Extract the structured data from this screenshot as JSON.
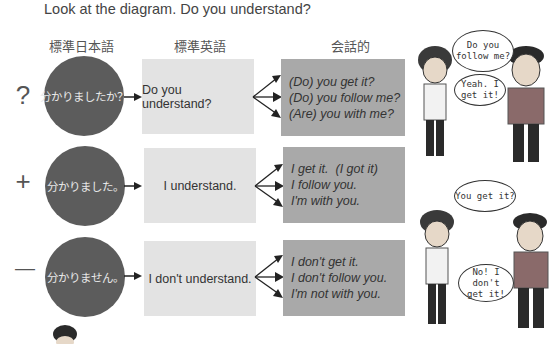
{
  "prompt": "Look at the diagram. Do you understand?",
  "columns": {
    "standard_japanese": "標準日本語",
    "standard_english": "標準英語",
    "conversational": "会話的"
  },
  "rows": [
    {
      "symbol": "?",
      "japanese": "分かりましたか？",
      "english": "Do you understand?",
      "conversational": [
        "(Do) you get it?",
        "(Do) you follow me?",
        "(Are) you with me?"
      ]
    },
    {
      "symbol": "+",
      "japanese": "分かりました。",
      "english": "I understand.",
      "conversational": [
        "I get it.  (I got it)",
        "I follow you.",
        "I'm with you."
      ]
    },
    {
      "symbol": "—",
      "japanese": "分かりません。",
      "english": "I don't understand.",
      "conversational": [
        "I don't get it.",
        "I don't follow you.",
        "I'm not with you."
      ]
    }
  ],
  "comics": {
    "top": {
      "question": "Do you follow me?",
      "answer": "Yeah. I get it!"
    },
    "bottom": {
      "question": "You get it?",
      "answer": "No! I don't get it!"
    }
  },
  "colors": {
    "circle": "#5c5c5c",
    "light_box": "#e3e3e3",
    "dark_box": "#a9a9a9"
  }
}
